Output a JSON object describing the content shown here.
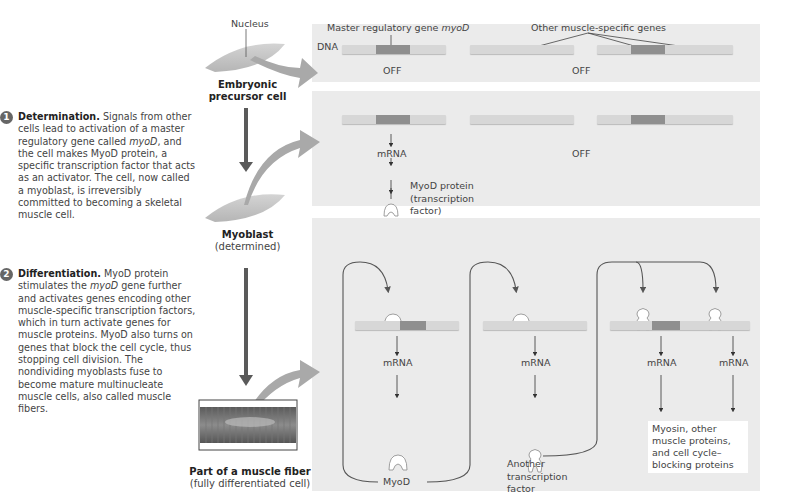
{
  "steps": [
    {
      "number": "1",
      "title": "Determination.",
      "body_parts": [
        " Signals from other cells lead to activation of a master regulatory gene called ",
        "myoD",
        ", and the cell makes MyoD protein, a specific transcription factor that acts as an activator. The cell, now called a myoblast, is irreversibly committed to becoming a skeletal muscle cell."
      ]
    },
    {
      "number": "2",
      "title": "Differentiation.",
      "body_parts": [
        " MyoD protein stimulates the ",
        "myoD",
        " gene further and activates genes encoding other muscle-specific transcription factors, which in turn activate genes for muscle proteins. MyoD also turns on genes that block the cell cycle, thus stopping cell division. The nondividing myoblasts fuse to become mature multinucleate muscle cells, also called muscle fibers."
      ]
    }
  ],
  "cells": {
    "nucleus_label": "Nucleus",
    "embryonic": {
      "title": "Embryonic",
      "title2": "precursor cell"
    },
    "myoblast": {
      "title": "Myoblast",
      "subtitle": "(determined)"
    },
    "fiber": {
      "title": "Part of a muscle fiber",
      "subtitle": "(fully differentiated cell)"
    }
  },
  "panel1": {
    "dna_label": "DNA",
    "master_gene_label": "Master regulatory gene ",
    "master_gene_name": "myoD",
    "other_genes_label": "Other muscle-specific genes",
    "off_1": "OFF",
    "off_2": "OFF"
  },
  "panel2": {
    "mrna": "mRNA",
    "off": "OFF",
    "protein_label_1": "MyoD protein",
    "protein_label_2": "(transcription",
    "protein_label_3": "factor)"
  },
  "panel3": {
    "mrna_1": "mRNA",
    "mrna_2": "mRNA",
    "mrna_3": "mRNA",
    "mrna_4": "mRNA",
    "myod_label": "MyoD",
    "another_tf_1": "Another",
    "another_tf_2": "transcription",
    "another_tf_3": "factor",
    "products_1": "Myosin, other",
    "products_2": "muscle proteins,",
    "products_3": "and cell cycle–",
    "products_4": "blocking proteins"
  },
  "colors": {
    "panel_bg": "#ebebeb",
    "dna": "#d7d7d7",
    "gene": "#8f8f8f",
    "arrow": "#555555",
    "curved_arrow": "#a9a9a9"
  }
}
